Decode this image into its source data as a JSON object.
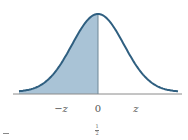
{
  "figure": {
    "colors": {
      "curve": "#2f5f80",
      "shade": "#a9c3d6",
      "axis": "#8a8a8a",
      "divider": "#6f8797",
      "label": "#555555"
    },
    "axis_labels": {
      "neg_z": "−z",
      "zero": "0",
      "pos_z": "z"
    },
    "fraction": {
      "numerator": "1",
      "denominator": "2"
    },
    "shaded_region": "x ≤ 0 (left half, area = 1/2)"
  }
}
